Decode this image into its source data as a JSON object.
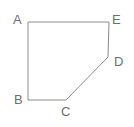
{
  "figure": {
    "name": "labeled-polygon-ABCDE",
    "type": "polygon",
    "background_color": "#ffffff",
    "stroke_color": "#8c8c8c",
    "stroke_width": 1,
    "label_color": "#6e6e6e",
    "canvas": {
      "width": 134,
      "height": 127
    },
    "vertices": [
      {
        "id": "A",
        "label": "A",
        "x": 28,
        "y": 22,
        "label_x": 13,
        "label_y": 13
      },
      {
        "id": "E",
        "label": "E",
        "x": 109,
        "y": 22,
        "label_x": 112,
        "label_y": 13
      },
      {
        "id": "D",
        "label": "D",
        "x": 108,
        "y": 57,
        "label_x": 114,
        "label_y": 55
      },
      {
        "id": "C",
        "label": "C",
        "x": 66,
        "y": 100,
        "label_x": 61,
        "label_y": 105
      },
      {
        "id": "B",
        "label": "B",
        "x": 28,
        "y": 100,
        "label_x": 14,
        "label_y": 93
      }
    ],
    "edges": [
      {
        "from": "A",
        "to": "E",
        "orientation": "horizontal"
      },
      {
        "from": "E",
        "to": "D",
        "orientation": "vertical"
      },
      {
        "from": "D",
        "to": "C",
        "orientation": "diagonal"
      },
      {
        "from": "C",
        "to": "B",
        "orientation": "horizontal"
      },
      {
        "from": "B",
        "to": "A",
        "orientation": "vertical"
      }
    ],
    "path_points": "28,22 109,22 108,57 66,100 28,100"
  }
}
